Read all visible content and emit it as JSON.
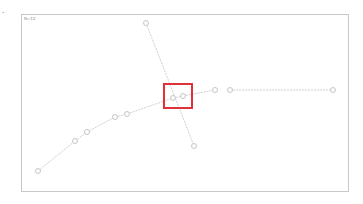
{
  "side_mark": "•",
  "panel": {
    "label": "N=12"
  },
  "colors": {
    "edge": "#d0d0d0",
    "node": "#b8b8b8",
    "highlight": "#e0303a",
    "border": "#c8c8c8"
  },
  "graph": {
    "nodes": [
      {
        "id": "n1",
        "x": 38,
        "y": 171
      },
      {
        "id": "n2",
        "x": 75,
        "y": 141
      },
      {
        "id": "n3",
        "x": 87,
        "y": 132
      },
      {
        "id": "n4",
        "x": 115,
        "y": 117
      },
      {
        "id": "n5",
        "x": 127,
        "y": 114
      },
      {
        "id": "n6",
        "x": 173,
        "y": 98
      },
      {
        "id": "n7",
        "x": 183,
        "y": 96
      },
      {
        "id": "n8",
        "x": 215,
        "y": 90
      },
      {
        "id": "n9",
        "x": 230,
        "y": 90
      },
      {
        "id": "n10",
        "x": 333,
        "y": 90
      },
      {
        "id": "n11",
        "x": 146,
        "y": 23
      },
      {
        "id": "n12",
        "x": 194,
        "y": 146
      }
    ],
    "edges": [
      [
        "n1",
        "n2"
      ],
      [
        "n2",
        "n3"
      ],
      [
        "n3",
        "n4"
      ],
      [
        "n4",
        "n5"
      ],
      [
        "n5",
        "n6"
      ],
      [
        "n6",
        "n7"
      ],
      [
        "n7",
        "n8"
      ],
      [
        "n9",
        "n10"
      ],
      [
        "n11",
        "n12"
      ]
    ]
  },
  "highlight_box": {
    "x": 163,
    "y": 83,
    "width": 30,
    "height": 26
  }
}
